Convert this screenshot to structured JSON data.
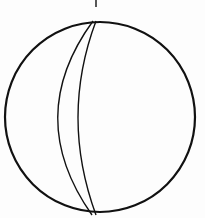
{
  "diagram": {
    "type": "stereonet",
    "north_tick": {
      "x": 96,
      "y1": 0,
      "y2": 7
    },
    "primitive_circle": {
      "cx": 100,
      "cy": 117,
      "r": 95,
      "stroke": "#111111",
      "stroke_width": 2.2
    },
    "great_circles": [
      {
        "name": "plane-1",
        "d": "M 93 21 Q 23 117 92 215"
      },
      {
        "name": "plane-2",
        "d": "M 96 21 Q 60 117 96 215"
      }
    ],
    "colors": {
      "line": "#111111",
      "background": "#fdfdfd"
    }
  }
}
